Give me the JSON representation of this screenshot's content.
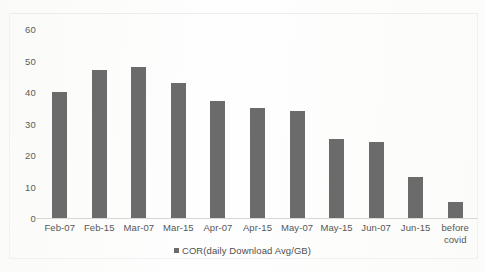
{
  "chart_data": {
    "type": "bar",
    "title": "",
    "subtitle": "",
    "xlabel": "",
    "ylabel": "",
    "categories": [
      "Feb-07",
      "Feb-15",
      "Mar-07",
      "Mar-15",
      "Apr-07",
      "Apr-15",
      "May-07",
      "May-15",
      "Jun-07",
      "Jun-15",
      "before\ncovid"
    ],
    "values": [
      40,
      47,
      48,
      43,
      37,
      35,
      34,
      25,
      24,
      13,
      5
    ],
    "series": [
      {
        "name": "COR(daily Download Avg/GB)",
        "values": [
          40,
          47,
          48,
          43,
          37,
          35,
          34,
          25,
          24,
          13,
          5
        ]
      }
    ],
    "ylim": [
      0,
      60
    ],
    "yticks": [
      0,
      10,
      20,
      30,
      40,
      50,
      60
    ],
    "ytick_labels": [
      "0",
      "10",
      "20",
      "30",
      "40",
      "50",
      "60"
    ],
    "grid": false,
    "legend": {
      "position": "bottom",
      "entries": [
        {
          "label": "COR(daily Download Avg/GB)",
          "marker": "legend-square-marker",
          "color": "#6b6b6b"
        }
      ]
    },
    "colors": {
      "bar": "#6b6b6b",
      "axis": "#d6d6d6",
      "text": "#565656",
      "background": "#fdfdfd"
    }
  }
}
